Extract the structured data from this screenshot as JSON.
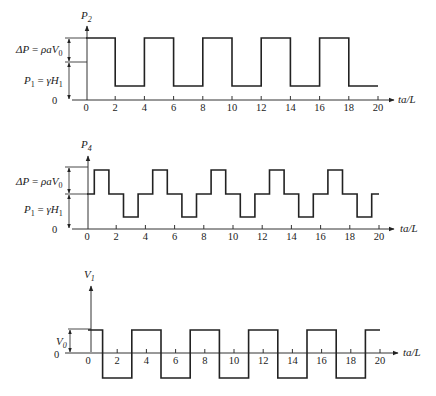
{
  "figure": {
    "x_axis_label": "ta/L",
    "x_ticks": [
      0,
      2,
      4,
      6,
      8,
      10,
      12,
      14,
      16,
      18,
      20
    ],
    "zero_label": "0"
  },
  "chart_data": [
    {
      "type": "line",
      "title": "P2",
      "ylabel": "P2",
      "xlabel": "ta/L",
      "xlim": [
        0,
        20
      ],
      "annotations": [
        "ΔP = ρaV0",
        "P1 = γH1",
        "0"
      ],
      "levels": {
        "base": 0,
        "P1": 1.0,
        "high": 1.6,
        "low": 0.4
      },
      "steps": [
        {
          "t0": 0,
          "t1": 2,
          "level": "high"
        },
        {
          "t0": 2,
          "t1": 4,
          "level": "low"
        },
        {
          "t0": 4,
          "t1": 6,
          "level": "high"
        },
        {
          "t0": 6,
          "t1": 8,
          "level": "low"
        },
        {
          "t0": 8,
          "t1": 10,
          "level": "high"
        },
        {
          "t0": 10,
          "t1": 12,
          "level": "low"
        },
        {
          "t0": 12,
          "t1": 14,
          "level": "high"
        },
        {
          "t0": 14,
          "t1": 16,
          "level": "low"
        },
        {
          "t0": 16,
          "t1": 18,
          "level": "high"
        },
        {
          "t0": 18,
          "t1": 20,
          "level": "low"
        }
      ],
      "x_ticks": [
        0,
        2,
        4,
        6,
        8,
        10,
        12,
        14,
        16,
        18,
        20
      ]
    },
    {
      "type": "line",
      "title": "P4",
      "ylabel": "P4",
      "xlabel": "ta/L",
      "xlim": [
        0,
        20
      ],
      "annotations": [
        "ΔP = ρaV0",
        "P1 = γH1",
        "0"
      ],
      "levels": {
        "base": 0,
        "P1": 1.0,
        "high": 1.6,
        "low": 0.4
      },
      "steps": [
        {
          "t0": 0,
          "t1": 0.5,
          "level": "P1"
        },
        {
          "t0": 0.5,
          "t1": 1.5,
          "level": "high"
        },
        {
          "t0": 1.5,
          "t1": 2.5,
          "level": "P1"
        },
        {
          "t0": 2.5,
          "t1": 3.5,
          "level": "low"
        },
        {
          "t0": 3.5,
          "t1": 4.5,
          "level": "P1"
        },
        {
          "t0": 4.5,
          "t1": 5.5,
          "level": "high"
        },
        {
          "t0": 5.5,
          "t1": 6.5,
          "level": "P1"
        },
        {
          "t0": 6.5,
          "t1": 7.5,
          "level": "low"
        },
        {
          "t0": 7.5,
          "t1": 8.5,
          "level": "P1"
        },
        {
          "t0": 8.5,
          "t1": 9.5,
          "level": "high"
        },
        {
          "t0": 9.5,
          "t1": 10.5,
          "level": "P1"
        },
        {
          "t0": 10.5,
          "t1": 11.5,
          "level": "low"
        },
        {
          "t0": 11.5,
          "t1": 12.5,
          "level": "P1"
        },
        {
          "t0": 12.5,
          "t1": 13.5,
          "level": "high"
        },
        {
          "t0": 13.5,
          "t1": 14.5,
          "level": "P1"
        },
        {
          "t0": 14.5,
          "t1": 15.5,
          "level": "low"
        },
        {
          "t0": 15.5,
          "t1": 16.5,
          "level": "P1"
        },
        {
          "t0": 16.5,
          "t1": 17.5,
          "level": "high"
        },
        {
          "t0": 17.5,
          "t1": 18.5,
          "level": "P1"
        },
        {
          "t0": 18.5,
          "t1": 19.5,
          "level": "low"
        },
        {
          "t0": 19.5,
          "t1": 20,
          "level": "P1"
        }
      ],
      "x_ticks": [
        0,
        2,
        4,
        6,
        8,
        10,
        12,
        14,
        16,
        18,
        20
      ]
    },
    {
      "type": "line",
      "title": "V1",
      "ylabel": "V1",
      "xlabel": "ta/L",
      "xlim": [
        0,
        20
      ],
      "annotations": [
        "V0",
        "0"
      ],
      "levels": {
        "base": 0,
        "high": 1,
        "low": -1
      },
      "steps": [
        {
          "t0": 0,
          "t1": 1,
          "level": "high"
        },
        {
          "t0": 1,
          "t1": 3,
          "level": "low"
        },
        {
          "t0": 3,
          "t1": 5,
          "level": "high"
        },
        {
          "t0": 5,
          "t1": 7,
          "level": "low"
        },
        {
          "t0": 7,
          "t1": 9,
          "level": "high"
        },
        {
          "t0": 9,
          "t1": 11,
          "level": "low"
        },
        {
          "t0": 11,
          "t1": 13,
          "level": "high"
        },
        {
          "t0": 13,
          "t1": 15,
          "level": "low"
        },
        {
          "t0": 15,
          "t1": 17,
          "level": "high"
        },
        {
          "t0": 17,
          "t1": 19,
          "level": "low"
        },
        {
          "t0": 19,
          "t1": 20,
          "level": "high"
        }
      ],
      "x_ticks": [
        0,
        2,
        4,
        6,
        8,
        10,
        12,
        14,
        16,
        18,
        20
      ]
    }
  ],
  "panels": [
    {
      "ylabel_main": "P",
      "ylabel_sub": "2",
      "dp_label": {
        "a": "ΔP",
        "eq": " = ",
        "b": "ρaV",
        "sub": "0"
      },
      "p1_label": {
        "a": "P",
        "a_sub": "1",
        "eq": " = ",
        "b": "γH",
        "b_sub": "1"
      }
    },
    {
      "ylabel_main": "P",
      "ylabel_sub": "4",
      "dp_label": {
        "a": "ΔP",
        "eq": " = ",
        "b": "ρaV",
        "sub": "0"
      },
      "p1_label": {
        "a": "P",
        "a_sub": "1",
        "eq": " = ",
        "b": "γH",
        "b_sub": "1"
      }
    },
    {
      "ylabel_main": "V",
      "ylabel_sub": "1",
      "v0_label": {
        "a": "V",
        "a_sub": "0"
      }
    }
  ]
}
